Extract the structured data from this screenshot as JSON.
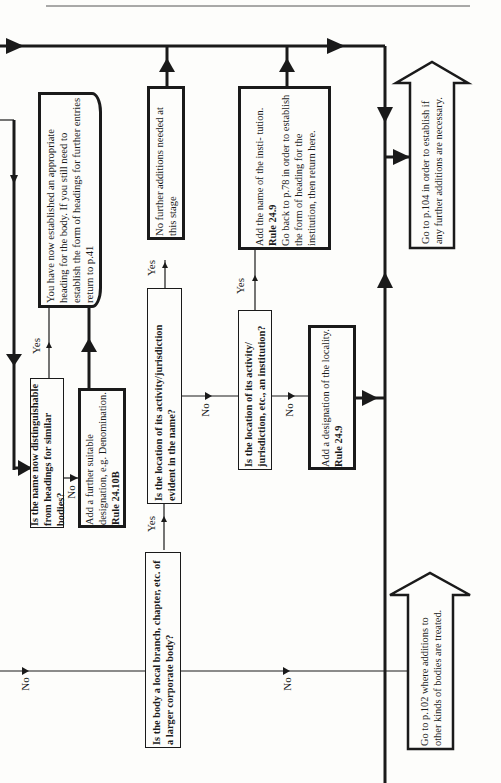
{
  "flowchart": {
    "orientation": "rotated-90-ccw",
    "nodes": {
      "q_local_branch": {
        "label": "Is the body a local branch, chapter, etc. of a larger corporate body?",
        "type": "decision"
      },
      "q_location_evident": {
        "label": "Is the location of its activity/jurisdiction evident in the name?",
        "type": "decision"
      },
      "q_location_institution": {
        "label": "Is the location of its activity/ jurisdiction, etc., an institution?",
        "type": "decision"
      },
      "q_distinguishable": {
        "label": "Is the name now distinguishable from headings for similar bodies?",
        "type": "decision"
      },
      "a_further_designation": {
        "text": "Add a further suitable designation, e.g. Denomination.",
        "rule": "Rule 24.10B",
        "type": "action"
      },
      "a_no_further": {
        "text": "No further additions needed at this stage",
        "type": "action"
      },
      "a_add_institution": {
        "text1": "Add the name of the insti- tution.",
        "rule": "Rule 24.9",
        "text2": "Go back to p.78 in order to establish the form of heading for the institution, then return here.",
        "type": "action"
      },
      "a_add_locality": {
        "text": "Add a designation of the locality.",
        "rule": "Rule 24.9",
        "type": "action"
      },
      "t_established": {
        "text": "You have now established an appropriate heading for the body. If you still need to establish the form of headings for further entries return to p.41",
        "type": "terminal"
      },
      "g_p104": {
        "text": "Go to p.104 in order to establish if any further additions are necessary.",
        "type": "goto-arrow"
      },
      "g_p102": {
        "text": "Go to p.102 where additions to other kinds of bodies are treated.",
        "type": "goto-arrow"
      }
    },
    "edge_labels": {
      "yes": "Yes",
      "no": "No"
    }
  }
}
